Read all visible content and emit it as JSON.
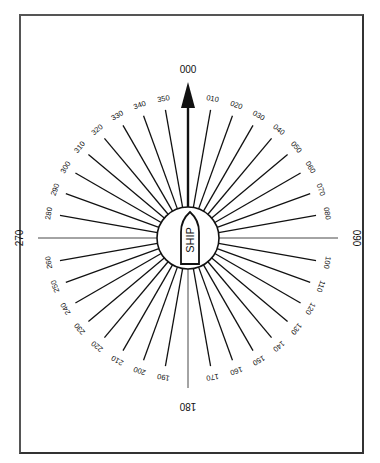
{
  "diagram": {
    "type": "relative-bearing-compass",
    "center_label": "SHIP",
    "heading_label": "000",
    "cardinal_labels": [
      "000",
      "090",
      "180",
      "270"
    ],
    "bearing_labels": [
      "010",
      "020",
      "030",
      "040",
      "050",
      "060",
      "070",
      "080",
      "100",
      "110",
      "120",
      "130",
      "140",
      "150",
      "160",
      "170",
      "190",
      "200",
      "210",
      "220",
      "230",
      "240",
      "250",
      "260",
      "280",
      "290",
      "300",
      "310",
      "320",
      "330",
      "340",
      "350"
    ],
    "colors": {
      "ink": "#111111",
      "frame": "#444444",
      "background": "#ffffff"
    }
  }
}
